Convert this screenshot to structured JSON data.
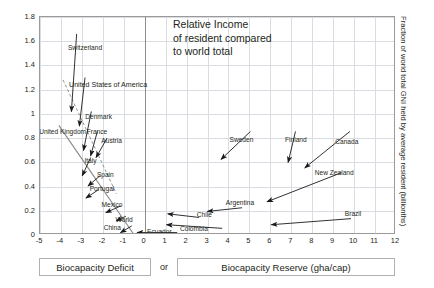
{
  "chart_data": {
    "type": "scatter",
    "title": "",
    "annotation": "Relative Income\nof resident compared\nto world total",
    "xlabel_left": "Biocapacity Deficit",
    "xlabel_mid": "or",
    "xlabel_right": "Biocapacity Reserve (gha/cap)",
    "ylabel_right": "Fraction of world total GNI held by average resident (billionths)",
    "xlim": [
      -5,
      12
    ],
    "ylim": [
      0,
      1.8
    ],
    "grid": true,
    "legend": "none",
    "xticks": [
      "-5",
      "-4",
      "-3",
      "-2",
      "-1",
      "0",
      "1",
      "2",
      "3",
      "4",
      "5",
      "6",
      "7",
      "8",
      "9",
      "10",
      "11",
      "12"
    ],
    "yticks": [
      "0",
      "0.2",
      "0.4",
      "0.6",
      "0.8",
      "1",
      "1.2",
      "1.4",
      "1.6",
      "1.8"
    ],
    "xtick_values": [
      -5,
      -4,
      -3,
      -2,
      -1,
      0,
      1,
      2,
      3,
      4,
      5,
      6,
      7,
      8,
      9,
      10,
      11,
      12
    ],
    "ytick_values": [
      0,
      0.2,
      0.4,
      0.6,
      0.8,
      1,
      1.2,
      1.4,
      1.6,
      1.8
    ],
    "points": [
      {
        "name": "Switzerland",
        "tail_x": -3.25,
        "tail_y": 1.66,
        "head_x": -3.5,
        "head_y": 1.02,
        "label_x": -2.85,
        "label_y": 1.555
      },
      {
        "name": "United States of America",
        "tail_x": -2.85,
        "tail_y": 1.3,
        "head_x": -3.12,
        "head_y": 0.9,
        "label_x": -1.75,
        "label_y": 1.235
      },
      {
        "name": "Denmark",
        "tail_x": -2.55,
        "tail_y": 1.02,
        "head_x": -2.92,
        "head_y": 0.7,
        "label_x": -2.2,
        "label_y": 0.985
      },
      {
        "name": "United Kingdom",
        "tail_x": -3.06,
        "tail_y": 0.855,
        "head_x": -3.06,
        "head_y": 0.855,
        "label_x": -3.92,
        "label_y": 0.855
      },
      {
        "name": "France",
        "tail_x": -2.26,
        "tail_y": 0.855,
        "head_x": -2.58,
        "head_y": 0.655,
        "label_x": -2.28,
        "label_y": 0.855
      },
      {
        "name": "Austria",
        "tail_x": -1.8,
        "tail_y": 0.8,
        "head_x": -2.32,
        "head_y": 0.64,
        "label_x": -1.58,
        "label_y": 0.785
      },
      {
        "name": "Italy",
        "tail_x": -2.58,
        "tail_y": 0.64,
        "head_x": -2.98,
        "head_y": 0.49,
        "label_x": -2.59,
        "label_y": 0.62
      },
      {
        "name": "Spain",
        "tail_x": -2.13,
        "tail_y": 0.49,
        "head_x": -2.7,
        "head_y": 0.405,
        "label_x": -1.88,
        "label_y": 0.5
      },
      {
        "name": "Portugal",
        "tail_x": -2.2,
        "tail_y": 0.375,
        "head_x": -2.8,
        "head_y": 0.305,
        "label_x": -2.04,
        "label_y": 0.385
      },
      {
        "name": "Mexico",
        "tail_x": -1.14,
        "tail_y": 0.24,
        "head_x": -1.85,
        "head_y": 0.185,
        "label_x": -1.56,
        "label_y": 0.255
      },
      {
        "name": "World",
        "tail_x": -0.9,
        "tail_y": 0.155,
        "head_x": -1.35,
        "head_y": 0.118,
        "label_x": -0.98,
        "label_y": 0.135
      },
      {
        "name": "China",
        "tail_x": -0.62,
        "tail_y": 0.075,
        "head_x": -1.15,
        "head_y": 0.02,
        "label_x": -1.55,
        "label_y": 0.07
      },
      {
        "name": "Sweden",
        "tail_x": 5.05,
        "tail_y": 0.855,
        "head_x": 3.65,
        "head_y": 0.625,
        "label_x": 4.62,
        "label_y": 0.79
      },
      {
        "name": "Finland",
        "tail_x": 7.2,
        "tail_y": 0.855,
        "head_x": 6.85,
        "head_y": 0.6,
        "label_x": 7.22,
        "label_y": 0.79
      },
      {
        "name": "Canada",
        "tail_x": 9.8,
        "tail_y": 0.855,
        "head_x": 7.65,
        "head_y": 0.555,
        "label_x": 9.65,
        "label_y": 0.775
      },
      {
        "name": "New Zealand",
        "tail_x": 9.4,
        "tail_y": 0.515,
        "head_x": 5.85,
        "head_y": 0.275,
        "label_x": 9.05,
        "label_y": 0.52
      },
      {
        "name": "Argentina",
        "tail_x": 4.65,
        "tail_y": 0.225,
        "head_x": 3.0,
        "head_y": 0.195,
        "label_x": 4.55,
        "label_y": 0.27
      },
      {
        "name": "Brazil",
        "tail_x": 9.85,
        "tail_y": 0.135,
        "head_x": 6.05,
        "head_y": 0.085,
        "label_x": 9.95,
        "label_y": 0.18
      },
      {
        "name": "Chile",
        "tail_x": 2.6,
        "tail_y": 0.145,
        "head_x": 1.1,
        "head_y": 0.175,
        "label_x": 2.85,
        "label_y": 0.175
      },
      {
        "name": "Colombia",
        "tail_x": 3.7,
        "tail_y": 0.055,
        "head_x": 1.05,
        "head_y": 0.085,
        "label_x": 2.35,
        "label_y": 0.06
      },
      {
        "name": "Ecuador",
        "tail_x": 1.55,
        "tail_y": 0.02,
        "head_x": -0.35,
        "head_y": 0.02,
        "label_x": 0.7,
        "label_y": 0.035
      }
    ],
    "trend_lines": [
      {
        "style": "dashed",
        "x1": -3.9,
        "y1": 1.28,
        "x2": -1.35,
        "y2": 0.34
      },
      {
        "style": "solid",
        "x1": -4.1,
        "y1": 0.905,
        "x2": -0.52,
        "y2": 0.005
      }
    ]
  },
  "axes": {
    "y_right_title": "Fraction of world total GNI held by average resident (billionths)"
  },
  "annotation": {
    "text": "Relative Income\nof resident compared\nto world total"
  },
  "legend": {
    "deficit": "Biocapacity Deficit",
    "or": "or",
    "reserve": "Biocapacity Reserve (gha/cap)"
  },
  "colors": {
    "grid": "#d9dde2",
    "axis": "#8d8d8d",
    "text": "#231f20",
    "arrow": "#1a1a1a",
    "frame": "#9a9a9a"
  }
}
